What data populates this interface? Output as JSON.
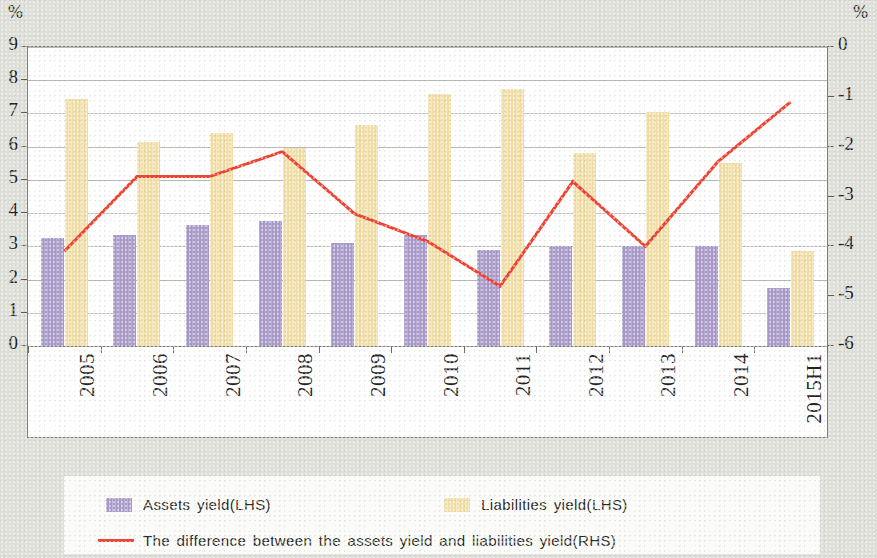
{
  "axes": {
    "left_unit": "%",
    "right_unit": "%",
    "left_ticks": [
      "9",
      "8",
      "7",
      "6",
      "5",
      "4",
      "3",
      "2",
      "1",
      "0"
    ],
    "right_ticks": [
      "0",
      "-1",
      "-2",
      "-3",
      "-4",
      "-5",
      "-6"
    ]
  },
  "legend": {
    "assets_label": "Assets yield(LHS)",
    "liabilities_label": "Liabilities yield(LHS)",
    "difference_label": "The difference between the assets yield and liabilities yield(RHS)"
  },
  "colors": {
    "assets": "#a796c8",
    "liabilities": "#f1dda2",
    "difference_line": "#ef4130",
    "grid": "#b9bab4",
    "frame": "#7e7f79",
    "page_background": "#dedfd8",
    "plot_background": "#ffffff"
  },
  "chart_data": {
    "type": "bar",
    "title": "",
    "xlabel": "",
    "ylabel": "%",
    "categories": [
      "2005",
      "2006",
      "2007",
      "2008",
      "2009",
      "2010",
      "2011",
      "2012",
      "2013",
      "2014",
      "2015H1"
    ],
    "series": [
      {
        "name": "Assets yield(LHS)",
        "axis": "left",
        "type": "bar",
        "color": "#a796c8",
        "values": [
          3.25,
          3.35,
          3.65,
          3.75,
          3.1,
          3.35,
          2.9,
          3.0,
          3.0,
          3.0,
          1.75
        ]
      },
      {
        "name": "Liabilities yield(LHS)",
        "axis": "left",
        "type": "bar",
        "color": "#f1dda2",
        "values": [
          7.45,
          6.15,
          6.4,
          5.95,
          6.65,
          7.6,
          7.75,
          5.8,
          7.05,
          5.5,
          2.85
        ]
      },
      {
        "name": "The difference between the assets yield and liabilities yield(RHS)",
        "axis": "right",
        "type": "line",
        "color": "#ef4130",
        "values": [
          -4.1,
          -2.6,
          -2.6,
          -2.1,
          -3.35,
          -3.9,
          -4.8,
          -2.7,
          -4.0,
          -2.3,
          -1.1
        ]
      }
    ],
    "ylim": [
      0,
      9
    ],
    "y2lim": [
      -6,
      0
    ],
    "grid": true,
    "legend_position": "bottom"
  }
}
